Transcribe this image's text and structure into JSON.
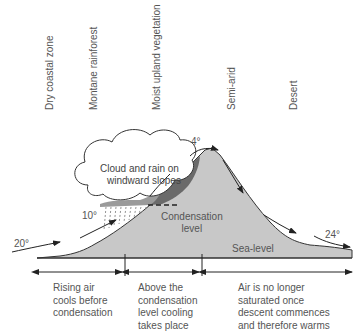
{
  "zones": [
    {
      "label": "Dry coastal zone"
    },
    {
      "label": "Montane rainforest"
    },
    {
      "label": "Moist upland vegetation"
    },
    {
      "label": "Semi-arid"
    },
    {
      "label": "Desert"
    }
  ],
  "cloud": {
    "line1": "Cloud and rain on",
    "line2": "windward slopes"
  },
  "condensation": {
    "line1": "Condensation",
    "line2": "level"
  },
  "sea_level": "Sea-level",
  "temperatures": {
    "start": "20°",
    "condensation": "10°",
    "summit": "4°",
    "end": "24°"
  },
  "stages": [
    {
      "lines": [
        "Rising air",
        "cools before",
        "condensation"
      ]
    },
    {
      "lines": [
        "Above the",
        "condensation",
        "level cooling",
        "takes place"
      ]
    },
    {
      "lines": [
        "Air is no longer",
        "saturated once",
        "descent commences",
        "and therefore warms"
      ]
    }
  ],
  "colors": {
    "mountain": "#c8c8c8",
    "cloud_dark": "#6a6a6a",
    "cloud_mid": "#9a9a9a",
    "text": "#555555",
    "lines": "#333333"
  }
}
